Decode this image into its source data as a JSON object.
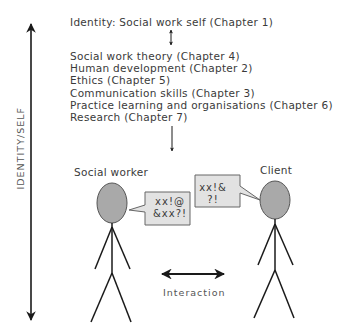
{
  "diagram": {
    "top_label": "Identity: Social work self (Chapter 1)",
    "topics": [
      "Social work theory (Chapter 4)",
      "Human development (Chapter 2)",
      "Ethics (Chapter 5)",
      "Communication skills (Chapter 3)",
      "Practice learning and organisations (Chapter 6)",
      "Research (Chapter 7)"
    ],
    "axis_label": "IDENTITY/SELF",
    "figures": {
      "left_label": "Social worker",
      "right_label": "Client"
    },
    "speech": {
      "social_worker_line1": "xx!@",
      "social_worker_line2": "&xx?!",
      "client_line1": "xx!&",
      "client_line2": "?!"
    },
    "interaction_label": "Interaction",
    "colors": {
      "head_fill": "#a9a9a9",
      "bubble_fill": "#e2e2e2",
      "stroke": "#1a1a1a",
      "text": "#3a3a3a"
    }
  }
}
